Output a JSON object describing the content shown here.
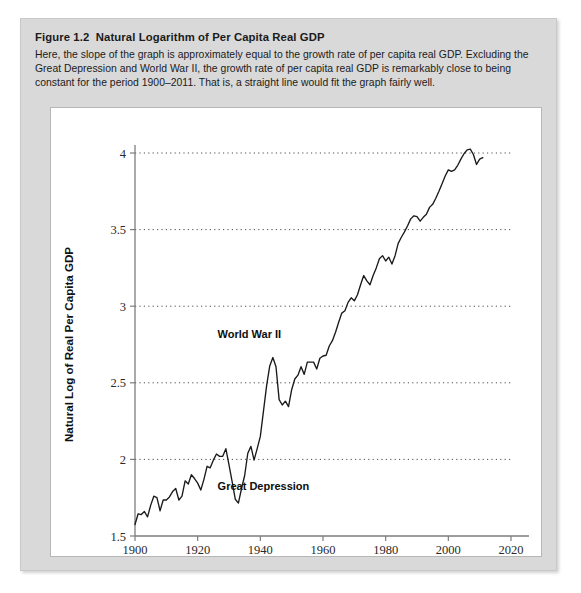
{
  "caption": {
    "figure_number": "Figure 1.2",
    "figure_title": "Natural Logarithm of Per Capita Real GDP",
    "body": "Here, the slope of the graph is approximately equal to the growth rate of per capita real GDP. Excluding the Great Depression and World War II, the growth rate of per capita real GDP is remarkably close to being constant for the period 1900–2011. That is, a straight line would fit the graph fairly well."
  },
  "chart_data": {
    "type": "line",
    "title": "Natural Logarithm of Per Capita Real GDP",
    "xlabel": "Year",
    "ylabel": "Natural Log of Real Per Capita GDP",
    "xlim": [
      1900,
      2020
    ],
    "ylim": [
      1.5,
      4.0
    ],
    "xticks": [
      1900,
      1920,
      1940,
      1960,
      1980,
      2000,
      2020
    ],
    "xtick_labels": [
      "1900",
      "1920",
      "1940",
      "1960",
      "1980",
      "2000",
      "2020"
    ],
    "yticks": [
      1.5,
      2.0,
      2.5,
      3.0,
      3.5,
      4.0
    ],
    "ytick_labels": [
      "1.5",
      "2",
      "2.5",
      "3",
      "3.5",
      "4"
    ],
    "grid": "horizontal-dotted",
    "legend": "none",
    "line_color": "#1a1a1a",
    "annotations": [
      {
        "text": "World War II",
        "x": 1936.5,
        "y": 2.79
      },
      {
        "text": "Great Depression",
        "x": 1941.0,
        "y": 1.8
      }
    ],
    "series": [
      {
        "name": "Natural log of real per capita GDP",
        "x": [
          1900,
          1901,
          1902,
          1903,
          1904,
          1905,
          1906,
          1907,
          1908,
          1909,
          1910,
          1911,
          1912,
          1913,
          1914,
          1915,
          1916,
          1917,
          1918,
          1919,
          1920,
          1921,
          1922,
          1923,
          1924,
          1925,
          1926,
          1927,
          1928,
          1929,
          1930,
          1931,
          1932,
          1933,
          1934,
          1935,
          1936,
          1937,
          1938,
          1939,
          1940,
          1941,
          1942,
          1943,
          1944,
          1945,
          1946,
          1947,
          1948,
          1949,
          1950,
          1951,
          1952,
          1953,
          1954,
          1955,
          1956,
          1957,
          1958,
          1959,
          1960,
          1961,
          1962,
          1963,
          1964,
          1965,
          1966,
          1967,
          1968,
          1969,
          1970,
          1971,
          1972,
          1973,
          1974,
          1975,
          1976,
          1977,
          1978,
          1979,
          1980,
          1981,
          1982,
          1983,
          1984,
          1985,
          1986,
          1987,
          1988,
          1989,
          1990,
          1991,
          1992,
          1993,
          1994,
          1995,
          1996,
          1997,
          1998,
          1999,
          2000,
          2001,
          2002,
          2003,
          2004,
          2005,
          2006,
          2007,
          2008,
          2009,
          2010,
          2011
        ],
        "y": [
          1.575,
          1.645,
          1.64,
          1.66,
          1.625,
          1.7,
          1.76,
          1.75,
          1.665,
          1.735,
          1.735,
          1.755,
          1.79,
          1.81,
          1.735,
          1.76,
          1.86,
          1.84,
          1.9,
          1.875,
          1.845,
          1.8,
          1.87,
          1.955,
          1.945,
          1.995,
          2.035,
          2.02,
          2.02,
          2.07,
          1.965,
          1.855,
          1.74,
          1.715,
          1.81,
          1.895,
          2.04,
          2.085,
          1.995,
          2.07,
          2.15,
          2.315,
          2.48,
          2.61,
          2.665,
          2.605,
          2.39,
          2.355,
          2.38,
          2.345,
          2.455,
          2.525,
          2.55,
          2.605,
          2.555,
          2.635,
          2.635,
          2.635,
          2.59,
          2.66,
          2.675,
          2.68,
          2.74,
          2.775,
          2.83,
          2.895,
          2.955,
          2.97,
          3.025,
          3.055,
          3.035,
          3.075,
          3.14,
          3.2,
          3.165,
          3.14,
          3.2,
          3.25,
          3.31,
          3.33,
          3.295,
          3.32,
          3.275,
          3.33,
          3.41,
          3.45,
          3.485,
          3.525,
          3.57,
          3.59,
          3.585,
          3.555,
          3.58,
          3.6,
          3.645,
          3.665,
          3.705,
          3.75,
          3.8,
          3.85,
          3.89,
          3.88,
          3.89,
          3.92,
          3.96,
          3.995,
          4.02,
          4.025,
          3.99,
          3.925,
          3.96,
          3.97
        ]
      }
    ]
  }
}
